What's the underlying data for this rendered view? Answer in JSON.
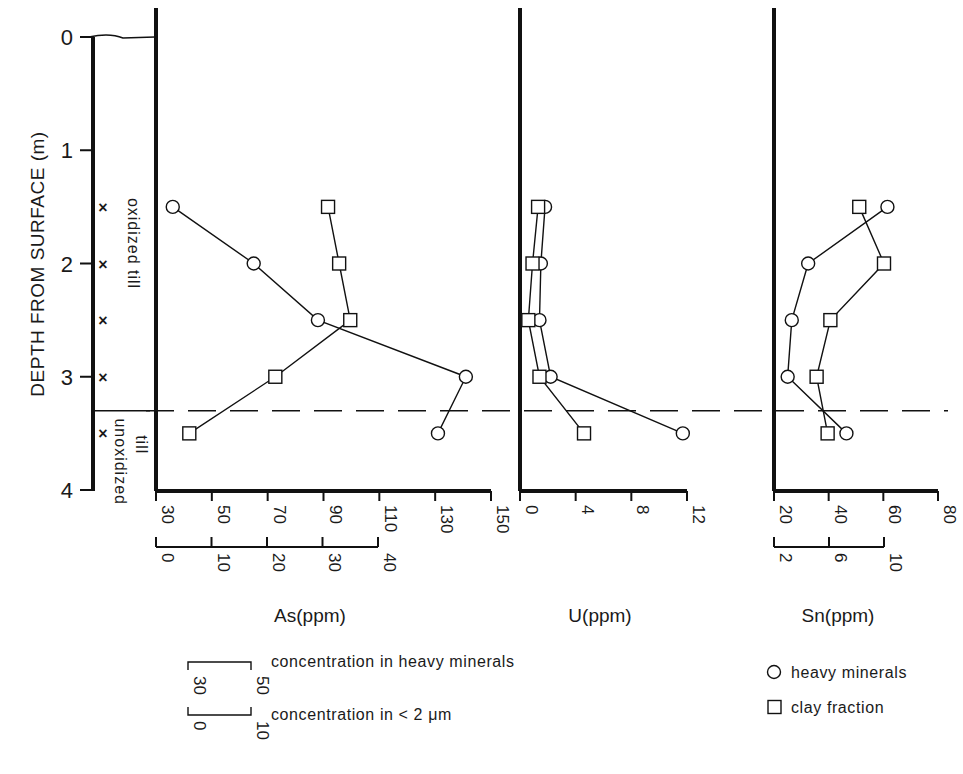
{
  "chart_data": {
    "type": "line",
    "orientation": "depth-profile (vertical depth axis, horizontal concentration axes)",
    "y_axis": {
      "label": "DEPTH FROM SURFACE (m)",
      "ticks": [
        0,
        1,
        2,
        3,
        4
      ],
      "range": [
        0,
        4
      ],
      "inverted": true
    },
    "depths": [
      1.5,
      2.0,
      2.5,
      3.0,
      3.5
    ],
    "boundary": {
      "depth": 3.3,
      "style": "dashed",
      "upper_label": "oxidized till",
      "lower_label": "unoxidized till"
    },
    "sample_markers": {
      "symbol": "x",
      "depths": [
        1.5,
        2.0,
        2.5,
        3.0,
        3.5
      ]
    },
    "panels": [
      {
        "id": "As",
        "xlabel": "As(ppm)",
        "heavy_axis": {
          "range": [
            30,
            150
          ],
          "ticks": [
            30,
            50,
            70,
            90,
            110,
            130,
            150
          ]
        },
        "clay_axis": {
          "range": [
            0,
            40
          ],
          "ticks": [
            0,
            10,
            20,
            30,
            40
          ]
        },
        "series": [
          {
            "name": "heavy minerals",
            "marker": "circle",
            "axis": "heavy",
            "values": [
              36,
              65,
              88,
              141,
              131
            ]
          },
          {
            "name": "clay fraction",
            "marker": "square",
            "axis": "clay",
            "values": [
              31,
              33,
              35,
              21.5,
              6
            ]
          }
        ]
      },
      {
        "id": "U",
        "xlabel": "U(ppm)",
        "heavy_axis": {
          "range": [
            0,
            12
          ],
          "ticks": [
            0,
            4,
            8,
            12
          ]
        },
        "clay_axis": null,
        "series": [
          {
            "name": "heavy minerals",
            "marker": "circle",
            "axis": "heavy",
            "values": [
              1.8,
              1.5,
              1.4,
              2.2,
              11.7
            ]
          },
          {
            "name": "clay fraction",
            "marker": "square",
            "axis": "heavy",
            "values": [
              1.3,
              0.9,
              0.6,
              1.4,
              4.6
            ]
          }
        ]
      },
      {
        "id": "Sn",
        "xlabel": "Sn(ppm)",
        "heavy_axis": {
          "range": [
            20,
            80
          ],
          "ticks": [
            20,
            40,
            60,
            80
          ]
        },
        "clay_axis": {
          "range": [
            2,
            10
          ],
          "ticks": [
            2,
            6,
            10
          ]
        },
        "series": [
          {
            "name": "heavy minerals",
            "marker": "circle",
            "axis": "heavy",
            "values": [
              61.5,
              32.5,
              26.5,
              25,
              46.5
            ]
          },
          {
            "name": "clay fraction",
            "marker": "square",
            "axis": "clay",
            "values": [
              8.2,
              10.0,
              6.1,
              5.1,
              5.9
            ]
          }
        ]
      }
    ],
    "legend": {
      "scale_key": [
        {
          "from": "30",
          "to": "50",
          "text": "concentration in heavy minerals"
        },
        {
          "from": "0",
          "to": "10",
          "text": "concentration in < 2 μm"
        }
      ],
      "symbols": [
        {
          "marker": "circle",
          "text": "heavy minerals"
        },
        {
          "marker": "square",
          "text": "clay fraction"
        }
      ],
      "placement": "bottom"
    }
  }
}
